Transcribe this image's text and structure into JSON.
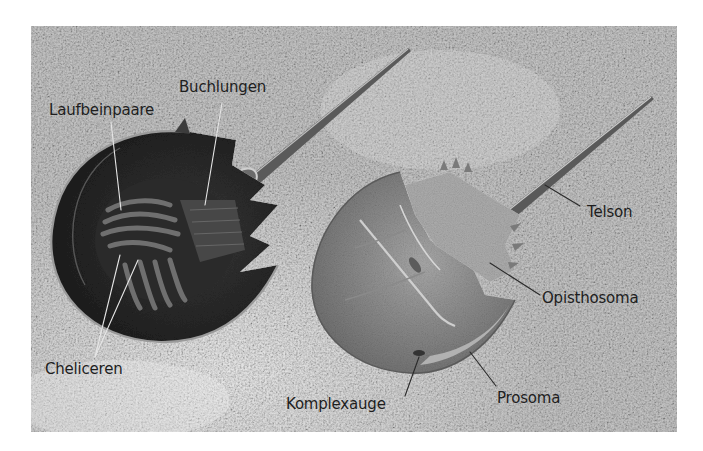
{
  "figure": {
    "background_color": "#ffffff",
    "photo_tone": "grayscale",
    "sand_color": "#b8b8b8",
    "crab_dark_color": "#2c2c2c",
    "crab_light_color": "#8a8a8a",
    "label_color": "#1e1e1e",
    "labels": {
      "laufbeinpaare": "Laufbeinpaare",
      "buchlungen": "Buchlungen",
      "cheliceren": "Cheliceren",
      "telson": "Telson",
      "opisthosoma": "Opisthosoma",
      "komplexauge": "Komplexauge",
      "prosoma": "Prosoma"
    }
  }
}
